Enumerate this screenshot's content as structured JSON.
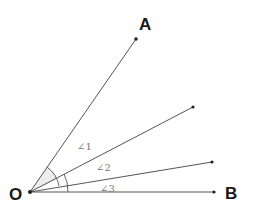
{
  "diagram": {
    "colors": {
      "line": "#555555",
      "point": "#222222",
      "label": "#1a1a1a",
      "angle_label": "#777777"
    },
    "points": {
      "O": {
        "label": "O",
        "x": 30,
        "y": 192
      },
      "A": {
        "label": "A",
        "x": 136,
        "y": 39
      },
      "B": {
        "label": "B",
        "x": 214,
        "y": 192
      },
      "P2": {
        "label": "",
        "x": 193,
        "y": 107
      },
      "P3": {
        "label": "",
        "x": 212,
        "y": 162
      }
    },
    "angles": [
      {
        "label": "∠1",
        "between": [
          "OA",
          "OP2"
        ]
      },
      {
        "label": "∠2",
        "between": [
          "OP2",
          "OP3"
        ]
      },
      {
        "label": "∠3",
        "between": [
          "OP3",
          "OB"
        ]
      }
    ]
  }
}
